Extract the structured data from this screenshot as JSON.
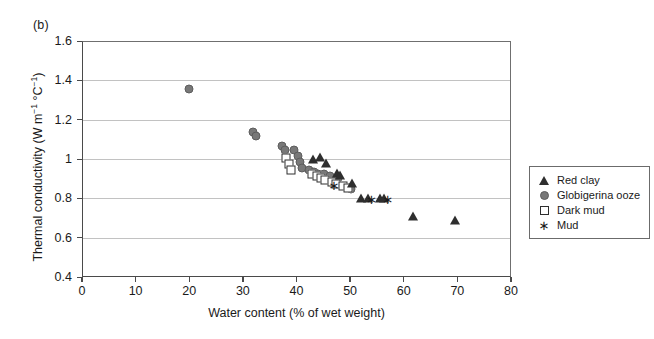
{
  "panel": {
    "label": "(b)"
  },
  "chart_data": {
    "type": "scatter",
    "title": "",
    "xlabel": "Water content (% of wet weight)",
    "ylabel": "Thermal conductivity (W m⁻¹ °C⁻¹)",
    "ylabel_parts": {
      "prefix": "Thermal conductivity (W m",
      "sup1": "−1",
      "mid": " °C",
      "sup2": "−1",
      "suffix": ")"
    },
    "xlim": [
      0,
      80
    ],
    "ylim": [
      0.4,
      1.6
    ],
    "xticks": [
      0,
      10,
      20,
      30,
      40,
      50,
      60,
      70,
      80
    ],
    "xtick_labels": [
      "0",
      "10",
      "20",
      "30",
      "40",
      "50",
      "60",
      "70",
      "80"
    ],
    "yticks": [
      0.4,
      0.6,
      0.8,
      1.0,
      1.2,
      1.4,
      1.6
    ],
    "ytick_labels": [
      "0.4",
      "0.6",
      "0.8",
      "1",
      "1.2",
      "1.4",
      "1.6"
    ],
    "grid": "horizontal",
    "legend_position": "right-outside",
    "colors": {
      "red_clay": "#2e2e2e",
      "globigerina_ooze": "#787878",
      "dark_mud": "#2e2e2e",
      "mud": "#1a1a1a",
      "gridline": "#c2c2c2",
      "axis": "#4a4a4a"
    },
    "series": [
      {
        "name": "Red clay",
        "marker": "filled-triangle",
        "color": "#2e2e2e",
        "points": [
          [
            43.0,
            1.0
          ],
          [
            44.3,
            1.01
          ],
          [
            45.5,
            0.98
          ],
          [
            47.5,
            0.93
          ],
          [
            48.2,
            0.92
          ],
          [
            50.3,
            0.88
          ],
          [
            52.0,
            0.8
          ],
          [
            53.4,
            0.8
          ],
          [
            55.6,
            0.8
          ],
          [
            56.4,
            0.8
          ],
          [
            61.8,
            0.71
          ],
          [
            69.6,
            0.69
          ]
        ]
      },
      {
        "name": "Globigerina ooze",
        "marker": "filled-circle",
        "color": "#787878",
        "points": [
          [
            20.0,
            1.355
          ],
          [
            31.8,
            1.135
          ],
          [
            32.4,
            1.115
          ],
          [
            37.3,
            1.065
          ],
          [
            37.8,
            1.045
          ],
          [
            39.6,
            1.045
          ],
          [
            40.2,
            1.015
          ],
          [
            40.6,
            0.985
          ],
          [
            41.0,
            0.955
          ],
          [
            42.4,
            0.945
          ],
          [
            43.2,
            0.935
          ],
          [
            44.0,
            0.925
          ],
          [
            45.1,
            0.925
          ],
          [
            46.2,
            0.915
          ],
          [
            47.8,
            0.905
          ],
          [
            50.2,
            0.845
          ]
        ]
      },
      {
        "name": "Dark mud",
        "marker": "open-square",
        "color": "#2e2e2e",
        "points": [
          [
            38.0,
            1.005
          ],
          [
            38.6,
            0.975
          ],
          [
            39.0,
            0.945
          ],
          [
            42.8,
            0.925
          ],
          [
            43.8,
            0.915
          ],
          [
            44.6,
            0.905
          ],
          [
            45.4,
            0.895
          ],
          [
            46.6,
            0.885
          ],
          [
            47.4,
            0.875
          ],
          [
            48.6,
            0.865
          ],
          [
            49.6,
            0.855
          ]
        ]
      },
      {
        "name": "Mud",
        "marker": "asterisk",
        "color": "#1a1a1a",
        "points": [
          [
            47.0,
            0.868
          ],
          [
            54.0,
            0.795
          ],
          [
            57.0,
            0.795
          ]
        ]
      }
    ]
  },
  "legend": {
    "items": [
      {
        "label": "Red clay",
        "marker": "filled-triangle"
      },
      {
        "label": "Globigerina ooze",
        "marker": "filled-circle"
      },
      {
        "label": "Dark mud",
        "marker": "open-square"
      },
      {
        "label": "Mud",
        "marker": "asterisk"
      }
    ]
  }
}
